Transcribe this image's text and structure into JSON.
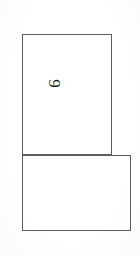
{
  "document": {
    "type": "scanned-form-fragment",
    "background_color": "#ffffff",
    "ink_color": "#1f1f1f",
    "border_color": "#5d5d5d",
    "width": 140,
    "height": 256
  },
  "boxes": [
    {
      "name": "upper-cell",
      "label": "",
      "x": 22,
      "y": 34,
      "width": 90,
      "height": 121,
      "content": ""
    },
    {
      "name": "lower-cell",
      "label": "",
      "x": 22,
      "y": 155,
      "width": 109,
      "height": 76,
      "content": ""
    }
  ],
  "annotations": [
    {
      "name": "digit-nine",
      "text": "9",
      "rotation_degrees": 90,
      "cell": "upper-cell",
      "position": "top-left"
    },
    {
      "name": "digit-zero",
      "text": "0",
      "rotation_degrees": 90,
      "cell": "lower-cell",
      "position": "bottom-left"
    }
  ]
}
